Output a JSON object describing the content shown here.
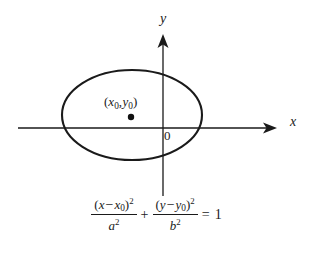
{
  "figure": {
    "type": "ellipse-diagram",
    "background_color": "#ffffff",
    "stroke_color": "#1a1a1a",
    "axes": {
      "x_axis_label": "x",
      "y_axis_label": "y",
      "origin_label": "0",
      "x_axis_y_position": 128,
      "y_axis_x_position": 163,
      "x_axis_start": 18,
      "x_axis_end": 277,
      "y_axis_top": 34,
      "y_axis_bottom": 196,
      "arrowheads": [
        "x-axis-right",
        "y-axis-top"
      ]
    },
    "ellipse": {
      "center_x": 132,
      "center_y": 115,
      "radius_x": 70,
      "radius_y": 45,
      "stroke_width": 2
    },
    "center_point": {
      "dot_x": 131,
      "dot_y": 117,
      "dot_radius": 3.2,
      "label_open_paren": "(",
      "label_x_var": "x",
      "label_x_sub": "0",
      "label_comma": ",",
      "label_y_var": "y",
      "label_y_sub": "0",
      "label_close_paren": ")"
    },
    "equation": {
      "term1": {
        "numerator_open": "(",
        "numerator_var": "x",
        "numerator_minus": "−",
        "numerator_sub_var": "x",
        "numerator_sub_index": "0",
        "numerator_close": ")",
        "numerator_power": "2",
        "denominator_var": "a",
        "denominator_power": "2"
      },
      "plus_sign": "+",
      "term2": {
        "numerator_open": "(",
        "numerator_var": "y",
        "numerator_minus": "−",
        "numerator_sub_var": "y",
        "numerator_sub_index": "0",
        "numerator_close": ")",
        "numerator_power": "2",
        "denominator_var": "b",
        "denominator_power": "2"
      },
      "equals_sign": "=",
      "right_hand_side": "1"
    }
  }
}
